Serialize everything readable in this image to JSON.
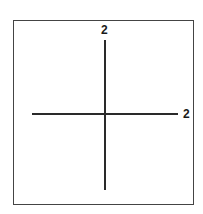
{
  "diagram": {
    "type": "coordinate-axes",
    "vertical_axis_label": "2",
    "horizontal_axis_label": "2",
    "colors": {
      "line": "#2a2a2a",
      "frame": "#444444",
      "background": "#ffffff"
    }
  }
}
